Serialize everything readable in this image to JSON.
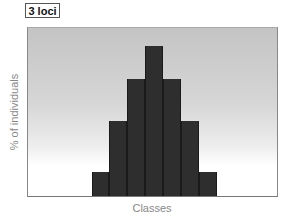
{
  "chart_data": {
    "type": "bar",
    "title": "3 loci",
    "xlabel": "Classes",
    "ylabel": "% of individuals",
    "categories": [
      "1",
      "2",
      "3",
      "4",
      "5",
      "6",
      "7"
    ],
    "values": [
      16,
      50,
      78,
      100,
      78,
      50,
      16
    ],
    "ylim": [
      0,
      112
    ],
    "grid": false,
    "legend": null,
    "tick_labels_shown": false
  },
  "colors": {
    "bar": "#2e2e2e",
    "background_top": "#c4c4c4",
    "background_bottom": "#ffffff",
    "label_text": "#888888"
  }
}
